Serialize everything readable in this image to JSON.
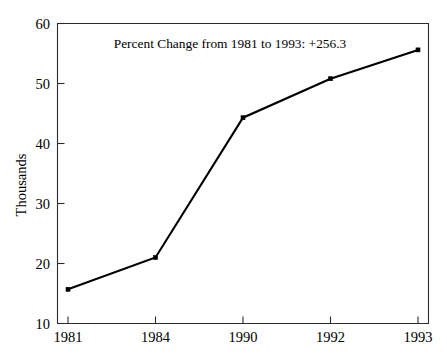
{
  "chart_data": {
    "type": "line",
    "title": "",
    "subtitle": "",
    "annotation": "Percent Change from 1981 to 1993:  +256.3",
    "categories": [
      "1981",
      "1984",
      "1990",
      "1992",
      "1993"
    ],
    "values": [
      15.7,
      21.0,
      44.3,
      50.8,
      55.6
    ],
    "series": [
      {
        "name": "",
        "values": [
          15.7,
          21.0,
          44.3,
          50.8,
          55.6
        ]
      }
    ],
    "xlabel": "",
    "ylabel": "Thousands",
    "ylim": [
      10,
      60
    ],
    "ytick_labels": [
      "10",
      "20",
      "30",
      "40",
      "50",
      "60"
    ],
    "ytick_values": [
      10,
      20,
      30,
      40,
      50,
      60
    ],
    "xtick_labels": [
      "1981",
      "1984",
      "1990",
      "1992",
      "1993"
    ],
    "grid": false,
    "legend": false,
    "legend_position": "none",
    "line_color": "#000000",
    "marker_color": "#000000",
    "marker_shape": "square",
    "axis_color": "#2b2b2b",
    "background_color": "#ffffff"
  },
  "labels": {
    "y_axis_title": "Thousands",
    "annotation": "Percent Change from 1981 to 1993:  +256.3",
    "ytick_0": "10",
    "ytick_1": "20",
    "ytick_2": "30",
    "ytick_3": "40",
    "ytick_4": "50",
    "ytick_5": "60",
    "xtick_0": "1981",
    "xtick_1": "1984",
    "xtick_2": "1990",
    "xtick_3": "1992",
    "xtick_4": "1993"
  }
}
